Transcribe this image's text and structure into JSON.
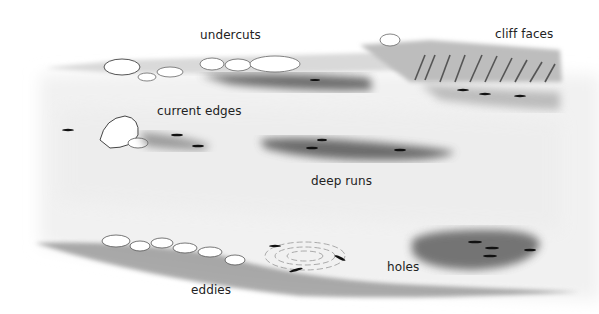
{
  "diagram": {
    "type": "illustration",
    "labels": [
      {
        "id": "undercuts",
        "text": "undercuts"
      },
      {
        "id": "cliff-faces",
        "text": "cliff faces"
      },
      {
        "id": "current-edges",
        "text": "current edges"
      },
      {
        "id": "deep-runs",
        "text": "deep runs"
      },
      {
        "id": "holes",
        "text": "holes"
      },
      {
        "id": "eddies",
        "text": "eddies"
      }
    ],
    "colors": {
      "background": "#ffffff",
      "water_shade": "#e9e9e9",
      "deep_water": "#5a5a5a",
      "fish": "#111111",
      "label_text": "#222222"
    }
  }
}
